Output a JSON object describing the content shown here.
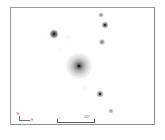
{
  "figure": {
    "type": "astronomical-image",
    "background_color": "#ffffff",
    "frame_color": "#9a9a9a"
  },
  "annotations": {
    "scalebar": {
      "label": "10\"",
      "length_px": 38,
      "tick_color": "#5a5a5a"
    },
    "compass": {
      "north_label": "N",
      "east_label": "E",
      "line_color": "#6e6e6e"
    }
  },
  "chart_data": {
    "type": "scatter",
    "title": "",
    "xlabel": "",
    "ylabel": "",
    "xlim": [
      0,
      139
    ],
    "ylim": [
      0,
      112
    ],
    "grid": false,
    "legend": null,
    "sources": [
      {
        "id": "central-extended-source",
        "kind": "extended",
        "x": 66,
        "y": 56,
        "size": 26,
        "peak": 0.95
      },
      {
        "id": "star-1",
        "kind": "point",
        "x": 41,
        "y": 24,
        "size": 9,
        "peak": 0.9
      },
      {
        "id": "star-2",
        "kind": "point",
        "x": 92,
        "y": 15,
        "size": 7,
        "peak": 0.7
      },
      {
        "id": "star-3",
        "kind": "point",
        "x": 88,
        "y": 5,
        "size": 5,
        "peak": 0.5
      },
      {
        "id": "star-4",
        "kind": "point",
        "x": 89,
        "y": 32,
        "size": 6,
        "peak": 0.55
      },
      {
        "id": "star-5",
        "kind": "point",
        "x": 87,
        "y": 84,
        "size": 7,
        "peak": 0.65
      },
      {
        "id": "star-6",
        "kind": "point",
        "x": 98,
        "y": 101,
        "size": 5,
        "peak": 0.45
      },
      {
        "id": "fuzz-1",
        "kind": "faint",
        "x": 55,
        "y": 27,
        "size": 6,
        "peak": 0.25
      },
      {
        "id": "fuzz-2",
        "kind": "faint",
        "x": 47,
        "y": 40,
        "size": 5,
        "peak": 0.2
      },
      {
        "id": "fuzz-3",
        "kind": "faint",
        "x": 58,
        "y": 36,
        "size": 5,
        "peak": 0.18
      },
      {
        "id": "fuzz-4",
        "kind": "faint",
        "x": 60,
        "y": 69,
        "size": 5,
        "peak": 0.22
      },
      {
        "id": "fuzz-5",
        "kind": "faint",
        "x": 72,
        "y": 78,
        "size": 6,
        "peak": 0.24
      },
      {
        "id": "fuzz-6",
        "kind": "faint",
        "x": 34,
        "y": 29,
        "size": 5,
        "peak": 0.16
      },
      {
        "id": "fuzz-7",
        "kind": "faint",
        "x": 44,
        "y": 15,
        "size": 4,
        "peak": 0.14
      },
      {
        "id": "fuzz-8",
        "kind": "faint",
        "x": 80,
        "y": 94,
        "size": 5,
        "peak": 0.15
      },
      {
        "id": "fuzz-9",
        "kind": "faint",
        "x": 104,
        "y": 24,
        "size": 4,
        "peak": 0.14
      }
    ]
  }
}
